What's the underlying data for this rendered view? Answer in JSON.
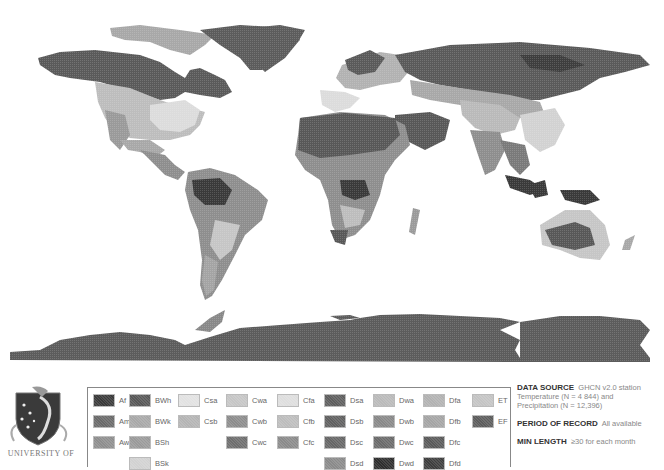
{
  "map": {
    "description": "World map of Köppen-Geiger climate classification (grayscale)",
    "ocean_color": "#ffffff"
  },
  "logo": {
    "caption": "UNIVERSITY OF",
    "icon": "university-crest-icon"
  },
  "legend": {
    "items": [
      {
        "code": "Af",
        "color": "#3a3a3a",
        "col": 0,
        "row": 0
      },
      {
        "code": "Am",
        "color": "#6a6a6a",
        "col": 0,
        "row": 1
      },
      {
        "code": "Aw",
        "color": "#8e8e8e",
        "col": 0,
        "row": 2
      },
      {
        "code": "BWh",
        "color": "#585858",
        "col": 1,
        "row": 0
      },
      {
        "code": "BWk",
        "color": "#a8a8a8",
        "col": 1,
        "row": 1
      },
      {
        "code": "BSh",
        "color": "#9a9a9a",
        "col": 1,
        "row": 2
      },
      {
        "code": "BSk",
        "color": "#d2d2d2",
        "col": 1,
        "row": 3
      },
      {
        "code": "Csa",
        "color": "#e2e2e2",
        "col": 2,
        "row": 0
      },
      {
        "code": "Csb",
        "color": "#b4b4b4",
        "col": 2,
        "row": 1
      },
      {
        "code": "Cwa",
        "color": "#c6c6c6",
        "col": 3,
        "row": 0
      },
      {
        "code": "Cwb",
        "color": "#8c8c8c",
        "col": 3,
        "row": 1
      },
      {
        "code": "Cwc",
        "color": "#6e6e6e",
        "col": 3,
        "row": 2
      },
      {
        "code": "Cfa",
        "color": "#dedede",
        "col": 4,
        "row": 0
      },
      {
        "code": "Cfb",
        "color": "#bdbdbd",
        "col": 4,
        "row": 1
      },
      {
        "code": "Cfc",
        "color": "#8a8a8a",
        "col": 4,
        "row": 2
      },
      {
        "code": "Dsa",
        "color": "#5e5e5e",
        "col": 5,
        "row": 0
      },
      {
        "code": "Dsb",
        "color": "#606060",
        "col": 5,
        "row": 1
      },
      {
        "code": "Dsc",
        "color": "#666666",
        "col": 5,
        "row": 2
      },
      {
        "code": "Dsd",
        "color": "#8a8a8a",
        "col": 5,
        "row": 3
      },
      {
        "code": "Dwa",
        "color": "#bababa",
        "col": 6,
        "row": 0
      },
      {
        "code": "Dwb",
        "color": "#888888",
        "col": 6,
        "row": 1
      },
      {
        "code": "Dwc",
        "color": "#6a6a6a",
        "col": 6,
        "row": 2
      },
      {
        "code": "Dwd",
        "color": "#2e2e2e",
        "col": 6,
        "row": 3
      },
      {
        "code": "Dfa",
        "color": "#b2b2b2",
        "col": 7,
        "row": 0
      },
      {
        "code": "Dfb",
        "color": "#a4a4a4",
        "col": 7,
        "row": 1
      },
      {
        "code": "Dfc",
        "color": "#5a5a5a",
        "col": 7,
        "row": 2
      },
      {
        "code": "Dfd",
        "color": "#3e3e3e",
        "col": 7,
        "row": 3
      },
      {
        "code": "ET",
        "color": "#c4c4c4",
        "col": 8,
        "row": 0
      },
      {
        "code": "EF",
        "color": "#5c5c5c",
        "col": 8,
        "row": 1
      }
    ]
  },
  "info": {
    "data_source_label": "DATA SOURCE",
    "data_source_value": "GHCN v2.0 station",
    "temperature_line": "Temperature (N = 4 844) and",
    "precipitation_line": "Precipitation (N = 12,396)",
    "period_label": "PERIOD OF RECORD",
    "period_value": "All available",
    "min_length_label": "MIN LENGTH",
    "min_length_value": "≥30 for each month"
  }
}
